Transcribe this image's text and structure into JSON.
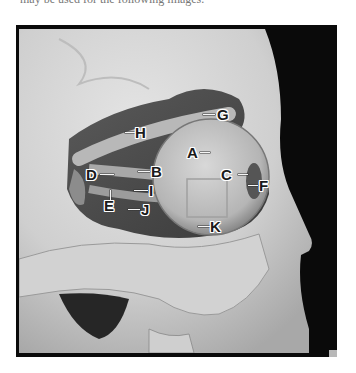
{
  "caption": "may be used for the following images.",
  "figure": {
    "colors": {
      "background": "#0a0a0a",
      "bone": "#d8d8d8",
      "eyeball": "#c9c9c9",
      "label_text": "#1a1a1a",
      "label_outline": "#ffffff"
    },
    "labels": [
      {
        "id": "A",
        "text": "A"
      },
      {
        "id": "B",
        "text": "B"
      },
      {
        "id": "C",
        "text": "C"
      },
      {
        "id": "D",
        "text": "D"
      },
      {
        "id": "E",
        "text": "E"
      },
      {
        "id": "F",
        "text": "F"
      },
      {
        "id": "G",
        "text": "G"
      },
      {
        "id": "H",
        "text": "H"
      },
      {
        "id": "I",
        "text": "I"
      },
      {
        "id": "J",
        "text": "J"
      },
      {
        "id": "K",
        "text": "K"
      }
    ]
  }
}
